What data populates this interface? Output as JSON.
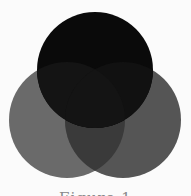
{
  "diagram": {
    "type": "venn",
    "sets": [
      {
        "id": "top",
        "name": "top-circle",
        "color": "#0a0a0a"
      },
      {
        "id": "left",
        "name": "left-circle",
        "color": "#6a6a6a"
      },
      {
        "id": "right",
        "name": "right-circle",
        "color": "#555555"
      }
    ],
    "overlaps": [
      {
        "name": "top-left-overlap",
        "sets": [
          "top",
          "left"
        ],
        "color": "#141414"
      },
      {
        "name": "top-right-overlap",
        "sets": [
          "top",
          "right"
        ],
        "color": "#111111"
      },
      {
        "name": "left-right-overlap",
        "sets": [
          "left",
          "right"
        ],
        "color": "#3a3a3a"
      },
      {
        "name": "center-overlap",
        "sets": [
          "top",
          "left",
          "right"
        ],
        "color": "#141414"
      }
    ],
    "background": "#fbfbfb"
  },
  "caption": "Figure 1"
}
